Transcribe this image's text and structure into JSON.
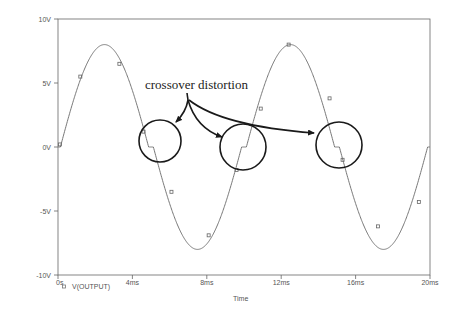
{
  "chart_data": {
    "type": "line",
    "title": "",
    "xlabel": "Time",
    "ylabel": "",
    "xlim": [
      0,
      20
    ],
    "ylim": [
      -10,
      10
    ],
    "x_unit": "ms",
    "grid": false,
    "legend_position": "bottom-left",
    "x_ticks": [
      {
        "value": 0,
        "label": "0s"
      },
      {
        "value": 4,
        "label": "4ms"
      },
      {
        "value": 8,
        "label": "8ms"
      },
      {
        "value": 12,
        "label": "12ms"
      },
      {
        "value": 16,
        "label": "16ms"
      },
      {
        "value": 20,
        "label": "20ms"
      }
    ],
    "y_ticks": [
      {
        "value": 10,
        "label": "10V"
      },
      {
        "value": 5,
        "label": "5V"
      },
      {
        "value": 0,
        "label": "0V"
      },
      {
        "value": -5,
        "label": "-5V"
      },
      {
        "value": -10,
        "label": "-10V"
      }
    ],
    "series": [
      {
        "name": "V(OUTPUT)",
        "color": "#777777",
        "model": {
          "amplitude": 8.7,
          "period_ms": 10,
          "dead_zone_v": 0.7,
          "flat_v": 0.0
        },
        "x": [
          0,
          0.5,
          1,
          1.5,
          2,
          2.5,
          3,
          3.5,
          4,
          4.5,
          5,
          5.5,
          6,
          6.5,
          7,
          7.5,
          8,
          8.5,
          9,
          9.5,
          10,
          10.5,
          11,
          11.5,
          12,
          12.5,
          13,
          13.5,
          14,
          14.5,
          15,
          15.5,
          16,
          16.5,
          17,
          17.5,
          18,
          18.5,
          19,
          19.5,
          20
        ],
        "values": [
          0.0,
          2.0,
          4.4,
          6.3,
          7.6,
          8.0,
          7.6,
          6.3,
          4.4,
          2.0,
          0.0,
          -2.0,
          -4.4,
          -6.3,
          -7.6,
          -8.0,
          -7.6,
          -6.3,
          -4.4,
          -2.0,
          0.0,
          2.0,
          4.4,
          6.3,
          7.6,
          8.0,
          7.6,
          6.3,
          4.4,
          2.0,
          0.0,
          -2.0,
          -4.4,
          -6.3,
          -7.6,
          -8.0,
          -7.6,
          -6.3,
          -4.4,
          -2.0,
          0.0
        ],
        "markers": [
          {
            "x": 0.1,
            "y": 0.2
          },
          {
            "x": 1.2,
            "y": 5.5
          },
          {
            "x": 3.3,
            "y": 6.5
          },
          {
            "x": 4.6,
            "y": 1.2
          },
          {
            "x": 6.1,
            "y": -3.5
          },
          {
            "x": 8.1,
            "y": -6.9
          },
          {
            "x": 9.6,
            "y": -1.8
          },
          {
            "x": 10.9,
            "y": 3.0
          },
          {
            "x": 12.4,
            "y": 8.0
          },
          {
            "x": 14.6,
            "y": 3.8
          },
          {
            "x": 15.3,
            "y": -1.0
          },
          {
            "x": 17.2,
            "y": -6.2
          },
          {
            "x": 19.4,
            "y": -4.3
          }
        ]
      }
    ],
    "annotations": [
      {
        "text": "crossover distortion",
        "text_x": 145,
        "text_y": 89,
        "circles": [
          {
            "cx": 160,
            "cy": 141,
            "r": 21
          },
          {
            "cx": 243,
            "cy": 147,
            "r": 23
          },
          {
            "cx": 339,
            "cy": 145,
            "r": 23
          }
        ]
      }
    ]
  },
  "legend": {
    "marker": "square-marker",
    "label": "V(OUTPUT)"
  },
  "axis": {
    "x_title": "Time"
  },
  "annotation": {
    "text": "crossover distortion"
  }
}
